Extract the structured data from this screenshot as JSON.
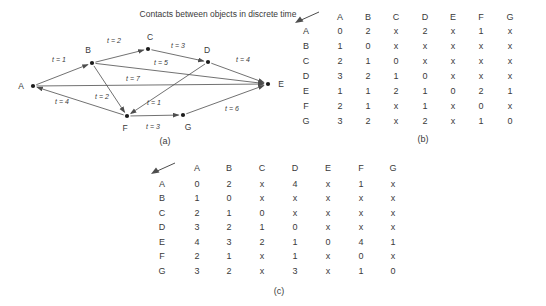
{
  "title": "Contacts between objects in discrete time",
  "colors": {
    "text": "#3a3a3a",
    "line": "#4d4d4d",
    "node": "#1c1c1c"
  },
  "graph": {
    "caption": "(a)",
    "caption_x": 165,
    "caption_y": 141,
    "nodes": [
      {
        "id": "A",
        "x": 33,
        "y": 86,
        "label_x": 21,
        "label_y": 89
      },
      {
        "id": "B",
        "x": 92,
        "y": 63,
        "label_x": 88,
        "label_y": 53
      },
      {
        "id": "C",
        "x": 148,
        "y": 49,
        "label_x": 150,
        "label_y": 40
      },
      {
        "id": "D",
        "x": 208,
        "y": 62,
        "label_x": 207,
        "label_y": 53
      },
      {
        "id": "E",
        "x": 268,
        "y": 84,
        "label_x": 281,
        "label_y": 87
      },
      {
        "id": "F",
        "x": 127,
        "y": 116,
        "label_x": 125,
        "label_y": 131
      },
      {
        "id": "G",
        "x": 183,
        "y": 115,
        "label_x": 188,
        "label_y": 130
      }
    ],
    "edges": [
      {
        "from": "A",
        "to": "B",
        "label": "t = 1",
        "label_x": 59,
        "label_y": 62
      },
      {
        "from": "B",
        "to": "C",
        "label": "t = 2",
        "label_x": 114,
        "label_y": 43
      },
      {
        "from": "C",
        "to": "D",
        "label": "t = 3",
        "label_x": 178,
        "label_y": 48
      },
      {
        "from": "D",
        "to": "E",
        "label": "t = 4",
        "label_x": 243,
        "label_y": 62
      },
      {
        "from": "B",
        "to": "E",
        "label": "t = 5",
        "label_x": 161,
        "label_y": 65
      },
      {
        "from": "A",
        "to": "E",
        "label": "t = 7",
        "label_x": 133,
        "label_y": 81
      },
      {
        "from": "F",
        "to": "A",
        "label": "t = 4",
        "label_x": 62,
        "label_y": 104
      },
      {
        "from": "B",
        "to": "F",
        "label": "t = 2",
        "label_x": 102,
        "label_y": 99
      },
      {
        "from": "D",
        "to": "F",
        "label": "t = 1",
        "label_x": 154,
        "label_y": 105
      },
      {
        "from": "F",
        "to": "G",
        "label": "t = 3",
        "label_x": 153,
        "label_y": 129
      },
      {
        "from": "G",
        "to": "E",
        "label": "t = 6",
        "label_x": 232,
        "label_y": 111
      }
    ]
  },
  "matrix_b": {
    "caption": "(b)",
    "corner_icon": "arrow-down-left",
    "columns": [
      "A",
      "B",
      "C",
      "D",
      "E",
      "F",
      "G"
    ],
    "rows": [
      {
        "label": "A",
        "cells": [
          "0",
          "2",
          "x",
          "2",
          "x",
          "1",
          "x"
        ]
      },
      {
        "label": "B",
        "cells": [
          "1",
          "0",
          "x",
          "x",
          "x",
          "x",
          "x"
        ]
      },
      {
        "label": "C",
        "cells": [
          "2",
          "1",
          "0",
          "x",
          "x",
          "x",
          "x"
        ]
      },
      {
        "label": "D",
        "cells": [
          "3",
          "2",
          "1",
          "0",
          "x",
          "x",
          "x"
        ]
      },
      {
        "label": "E",
        "cells": [
          "1",
          "1",
          "2",
          "1",
          "0",
          "2",
          "1"
        ]
      },
      {
        "label": "F",
        "cells": [
          "2",
          "1",
          "x",
          "1",
          "x",
          "0",
          "x"
        ]
      },
      {
        "label": "G",
        "cells": [
          "3",
          "2",
          "x",
          "2",
          "x",
          "1",
          "0"
        ]
      }
    ]
  },
  "matrix_c": {
    "caption": "(c)",
    "corner_icon": "arrow-down-left",
    "columns": [
      "A",
      "B",
      "C",
      "D",
      "E",
      "F",
      "G"
    ],
    "rows": [
      {
        "label": "A",
        "cells": [
          "0",
          "2",
          "x",
          "4",
          "x",
          "1",
          "x"
        ]
      },
      {
        "label": "B",
        "cells": [
          "1",
          "0",
          "x",
          "x",
          "x",
          "x",
          "x"
        ]
      },
      {
        "label": "C",
        "cells": [
          "2",
          "1",
          "0",
          "x",
          "x",
          "x",
          "x"
        ]
      },
      {
        "label": "D",
        "cells": [
          "3",
          "2",
          "1",
          "0",
          "x",
          "x",
          "x"
        ]
      },
      {
        "label": "E",
        "cells": [
          "4",
          "3",
          "2",
          "1",
          "0",
          "4",
          "1"
        ]
      },
      {
        "label": "F",
        "cells": [
          "2",
          "1",
          "x",
          "1",
          "x",
          "0",
          "x"
        ]
      },
      {
        "label": "G",
        "cells": [
          "3",
          "2",
          "x",
          "3",
          "x",
          "1",
          "0"
        ]
      }
    ]
  }
}
